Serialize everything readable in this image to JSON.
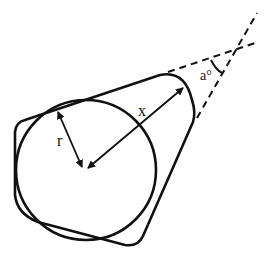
{
  "diagram": {
    "labels": {
      "radius": "r",
      "distance": "x",
      "angle": "a°"
    },
    "colors": {
      "stroke": "#111111",
      "background": "#ffffff"
    }
  }
}
